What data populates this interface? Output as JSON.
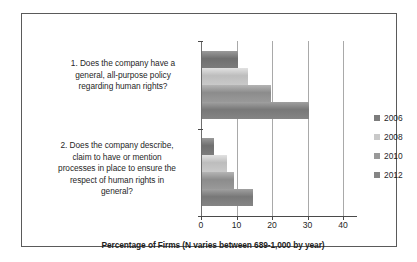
{
  "chart_data": {
    "type": "bar",
    "orientation": "horizontal",
    "title": "",
    "xlabel": "Percentage of Firms (N varies between 689-1,000 by year)",
    "ylabel": "",
    "xlim": [
      0,
      40
    ],
    "xticks": [
      0,
      10,
      20,
      30,
      40
    ],
    "grid": true,
    "legend_position": "right",
    "categories": [
      "1. Does the company have a general, all-purpose policy regarding human rights?",
      "2. Does the company describe, claim to have or mention processes in place to ensure the respect of human rights in general?"
    ],
    "series": [
      {
        "name": "2006",
        "color": "#7c7c7c",
        "values": [
          10,
          3.5
        ]
      },
      {
        "name": "2008",
        "color": "#c9c9c9",
        "values": [
          13,
          7
        ]
      },
      {
        "name": "2010",
        "color": "#999999",
        "values": [
          19.5,
          9
        ]
      },
      {
        "name": "2012",
        "color": "#858585",
        "values": [
          30,
          14.5
        ]
      }
    ]
  },
  "labels": {
    "category_0_lines": [
      "1. Does the company have a",
      "general, all-purpose policy",
      "regarding human rights?"
    ],
    "category_1_lines": [
      "2. Does the company describe,",
      "claim to have or mention",
      "processes in place to ensure the",
      "respect of human rights in",
      "general?"
    ],
    "category_0_text": "1. Does the company have a general, all-purpose policy regarding human rights?",
    "category_1_text": "2. Does the company describe, claim to have or mention processes in place to ensure the respect of human rights in general?"
  },
  "axis": {
    "title": "Percentage of Firms (N varies between 689-1,000 by year)",
    "ticks": [
      "0",
      "10",
      "20",
      "30",
      "40"
    ]
  },
  "legend": {
    "items": [
      {
        "label": "2006",
        "color": "#7c7c7c"
      },
      {
        "label": "2008",
        "color": "#c9c9c9"
      },
      {
        "label": "2010",
        "color": "#999999"
      },
      {
        "label": "2012",
        "color": "#858585"
      }
    ]
  }
}
